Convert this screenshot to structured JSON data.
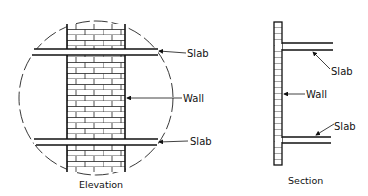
{
  "colors": {
    "ink": "#111111",
    "background": "#ffffff"
  },
  "elevation": {
    "caption": "Elevation",
    "labels": {
      "slab_top": "Slab",
      "wall": "Wall",
      "slab_bottom": "Slab"
    },
    "circle": {
      "cx": 96,
      "cy": 98,
      "r": 77,
      "style": "dashed"
    }
  },
  "section": {
    "caption": "Section",
    "labels": {
      "slab_top": "Slab",
      "wall": "Wall",
      "slab_bottom": "Slab"
    }
  }
}
